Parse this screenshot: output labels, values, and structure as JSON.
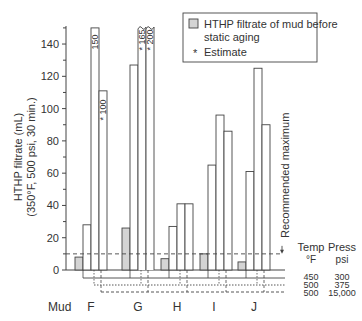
{
  "chart_data": {
    "type": "bar",
    "title": "",
    "ylabel_line1": "HTHP filtrate  (mL)",
    "ylabel_line2": "(350°F, 500 psi, 30 min.)",
    "xlabel": "Mud",
    "ylim": [
      0,
      150
    ],
    "yticks": [
      0,
      20,
      40,
      60,
      80,
      100,
      120,
      140
    ],
    "categories": [
      "F",
      "G",
      "H",
      "I",
      "J"
    ],
    "series": [
      {
        "name": "HTHP filtrate of mud before static aging",
        "style": "gray",
        "values": [
          8,
          26,
          7,
          10,
          5
        ]
      },
      {
        "name": "After aging 450°F / 300 psi",
        "style": "white",
        "values": [
          28,
          127,
          27,
          65,
          61
        ]
      },
      {
        "name": "After aging 500°F / 375 psi",
        "style": "white",
        "values": [
          150,
          165,
          41,
          96,
          125
        ]
      },
      {
        "name": "After aging 500°F / 15,000 psi",
        "style": "white",
        "values": [
          100,
          200,
          41,
          86,
          90
        ]
      }
    ],
    "bar_labels": [
      {
        "category": "F",
        "series": 2,
        "text": "150"
      },
      {
        "category": "F",
        "series": 3,
        "text": "* 100"
      },
      {
        "category": "G",
        "series": 2,
        "text": "* 165"
      },
      {
        "category": "G",
        "series": 3,
        "text": "* 200"
      }
    ],
    "broken_bars": [
      {
        "category": "G",
        "series": 2
      },
      {
        "category": "G",
        "series": 3
      }
    ],
    "reference_line": {
      "value": 10,
      "label": "Recommended maximum",
      "style": "dashed"
    },
    "legend": {
      "position": "top-right",
      "entries": [
        {
          "swatch": "gray",
          "label_line1": "HTHP filtrate of mud before",
          "label_line2": "static aging"
        },
        {
          "swatch": "*",
          "label_line1": "Estimate"
        }
      ]
    },
    "conditions_table": {
      "headers": [
        "Temp\n°F",
        "Press\npsi"
      ],
      "header_temp": [
        "Temp",
        "°F"
      ],
      "header_press": [
        "Press",
        "psi"
      ],
      "rows": [
        {
          "line": "solid",
          "temp": "450",
          "press": "300"
        },
        {
          "line": "dotted",
          "temp": "500",
          "press": "375"
        },
        {
          "line": "dashed",
          "temp": "500",
          "press": "15,000"
        }
      ]
    },
    "colors": {
      "gray_fill": "#d4d4d4",
      "line": "#444444"
    }
  }
}
